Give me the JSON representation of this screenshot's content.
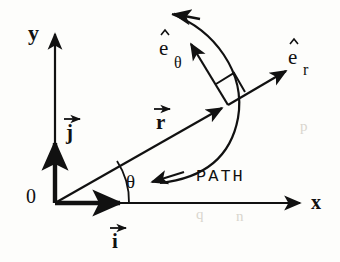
{
  "figure": {
    "kind": "polar-coordinate-vector-diagram",
    "background_color": "#fdfdfb",
    "ink_color": "#111111",
    "width": 340,
    "height": 262
  },
  "labels": {
    "axis_y": "y",
    "axis_x": "x",
    "origin": "0",
    "unit_vector_i": "i",
    "unit_vector_j": "j",
    "position_vector_r": "r",
    "angle_theta": "θ",
    "unit_radial_base": "e",
    "unit_radial_sub": "r",
    "unit_tangential_base": "e",
    "unit_tangential_sub": "θ",
    "path": "PATH"
  },
  "bleed_through": {
    "line_1": "q",
    "line_2": "n",
    "line_3": "p"
  },
  "geometry": {
    "origin": [
      55,
      203
    ],
    "y_axis_tip": [
      55,
      30
    ],
    "x_axis_tip": [
      303,
      203
    ],
    "particle_point": [
      228,
      105
    ],
    "er_tip": [
      291,
      67
    ],
    "i_vector_tip": [
      126,
      203
    ],
    "j_vector_tip": [
      55,
      137
    ],
    "theta_arc_radius": 74,
    "right_angle_marker": [
      228,
      105
    ]
  }
}
